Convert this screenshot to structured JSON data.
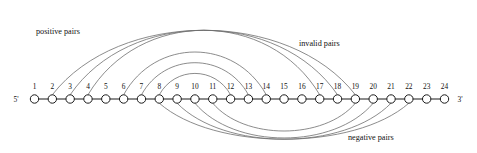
{
  "diagram": {
    "kind": "rna-secondary-structure-arc-diagram",
    "strand": {
      "five_prime_label": "5'",
      "three_prime_label": "3'",
      "node_count": 24,
      "node_labels": [
        "1",
        "2",
        "3",
        "4",
        "5",
        "6",
        "7",
        "8",
        "9",
        "10",
        "11",
        "12",
        "13",
        "14",
        "15",
        "16",
        "17",
        "18",
        "19",
        "20",
        "21",
        "22",
        "23",
        "24"
      ]
    },
    "labels": {
      "positive": "positive pairs",
      "invalid": "invalid pairs",
      "negative": "negative pairs"
    },
    "colors": {
      "arc": "#6e6e6e",
      "backbone": "#1a1a1a",
      "node_fill": "#ffffff",
      "text": "#111111"
    },
    "arc_groups": [
      {
        "name": "positive pairs",
        "side": "above",
        "pairs": [
          [
            2,
            19
          ],
          [
            3,
            18
          ],
          [
            4,
            17
          ]
        ]
      },
      {
        "name": "invalid pairs",
        "side": "above",
        "pairs": [
          [
            6,
            14
          ],
          [
            7,
            13
          ],
          [
            8,
            12
          ]
        ]
      },
      {
        "name": "negative pairs",
        "side": "below",
        "pairs": [
          [
            8,
            22
          ],
          [
            9,
            21
          ],
          [
            10,
            20
          ],
          [
            11,
            19
          ]
        ]
      }
    ]
  }
}
